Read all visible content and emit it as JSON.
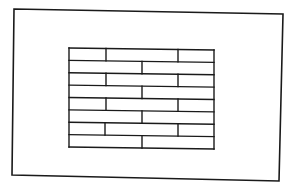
{
  "diagram": {
    "description": "Line drawing of a rectangular frame enclosing a running-bond brick / plank pattern",
    "stroke_color": "#1a1a1a",
    "background_color": "#ffffff",
    "outer_frame": {
      "corners": [
        [
          14,
          9
        ],
        [
          283,
          14
        ],
        [
          279,
          181
        ],
        [
          12,
          175
        ]
      ]
    },
    "brick_grid": {
      "left": 69,
      "right": 214,
      "top_left_y": 48,
      "top_right_y": 50,
      "bottom_left_y": 147,
      "bottom_right_y": 149,
      "row_count": 8,
      "rows": [
        {
          "index": 1,
          "pieces": 3,
          "dividers_x": [
            106,
            178
          ]
        },
        {
          "index": 2,
          "pieces": 2,
          "dividers_x": [
            142
          ]
        },
        {
          "index": 3,
          "pieces": 3,
          "dividers_x": [
            106,
            178
          ]
        },
        {
          "index": 4,
          "pieces": 2,
          "dividers_x": [
            142
          ]
        },
        {
          "index": 5,
          "pieces": 3,
          "dividers_x": [
            106,
            178
          ]
        },
        {
          "index": 6,
          "pieces": 2,
          "dividers_x": [
            142
          ]
        },
        {
          "index": 7,
          "pieces": 3,
          "dividers_x": [
            105,
            178
          ]
        },
        {
          "index": 8,
          "pieces": 2,
          "dividers_x": [
            142
          ]
        }
      ]
    }
  }
}
